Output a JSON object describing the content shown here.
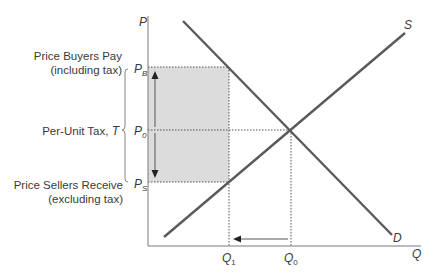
{
  "diagram": {
    "axes": {
      "y_label": "P",
      "x_label": "Q"
    },
    "curves": {
      "supply_label": "S",
      "demand_label": "D"
    },
    "price_levels": {
      "pb": {
        "main": "P",
        "sub": "B"
      },
      "p0": {
        "main": "P",
        "sub": "0"
      },
      "ps": {
        "main": "P",
        "sub": "S"
      }
    },
    "quantity_levels": {
      "q1": {
        "main": "Q",
        "sub": "1"
      },
      "q0": {
        "main": "Q",
        "sub": "0"
      }
    },
    "annotations": {
      "buyers_line1": "Price Buyers Pay",
      "buyers_line2": "(including tax)",
      "tax_label": "Per-Unit Tax, ",
      "tax_symbol": "T",
      "sellers_line1": "Price Sellers Receive",
      "sellers_line2": "(excluding tax)"
    },
    "colors": {
      "curve": "#5a5a5a",
      "axis": "#7a7a7a",
      "shaded_region": "#dcdcdc",
      "text": "#3a3a3a"
    }
  }
}
